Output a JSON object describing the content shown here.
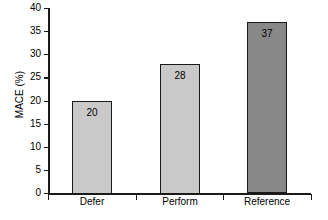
{
  "chart_data": {
    "type": "bar",
    "title": "",
    "subtitle": "",
    "xlabel": "",
    "ylabel": "MACE (%)",
    "categories": [
      "Defer",
      "Perform",
      "Reference"
    ],
    "values": [
      20,
      28,
      37
    ],
    "value_labels": [
      "20",
      "28",
      "37"
    ],
    "ylim": [
      0,
      40
    ],
    "yticks": [
      0,
      5,
      10,
      15,
      20,
      25,
      30,
      35,
      40
    ],
    "ytick_labels": [
      "0",
      "5",
      "10",
      "15",
      "20",
      "25",
      "30",
      "35",
      "40"
    ],
    "grid": false,
    "legend": false,
    "legend_position": "none",
    "bar_colors": [
      "#c9c9c9",
      "#c9c9c9",
      "#888888"
    ],
    "bar_edge_color": "#1a1a1a",
    "axis_color": "#1a1a1a",
    "background_color": "#ffffff",
    "label_position": "inside-top"
  }
}
